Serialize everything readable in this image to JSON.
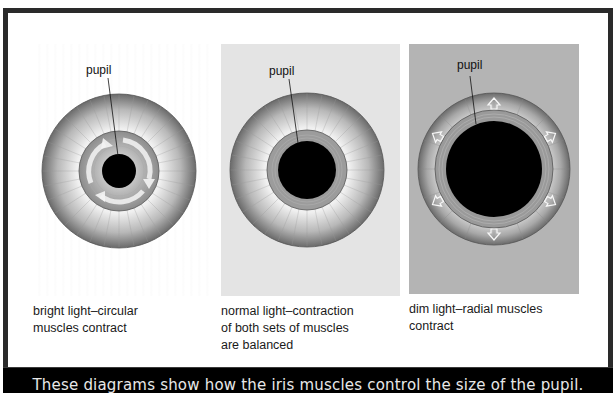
{
  "figure": {
    "caption": "These diagrams show how the iris muscles control the size of the pupil.",
    "colors": {
      "frame": "#2a2a2a",
      "caption_bar": "#000000",
      "caption_text": "#e8e8e8",
      "panel_1_bg": "#ffffff",
      "panel_2_bg": "#e4e4e4",
      "panel_3_bg": "#b4b4b4",
      "pupil": "#000000",
      "iris_outer": "#777777",
      "iris_inner": "#f2f2f2",
      "sphincter_ring": "#9a9a9a"
    },
    "panels": [
      {
        "id": "bright",
        "pupil_label": "pupil",
        "caption": "bright light–circular\nmuscles contract",
        "condition": "bright light",
        "muscles": "circular muscles contract",
        "pupil_size": "small",
        "arrows": "circular (clockwise)"
      },
      {
        "id": "normal",
        "pupil_label": "pupil",
        "caption": "normal light–contraction\nof both sets of muscles\nare balanced",
        "condition": "normal light",
        "muscles": "contraction of both sets of muscles are balanced",
        "pupil_size": "medium",
        "arrows": "none"
      },
      {
        "id": "dim",
        "pupil_label": "pupil",
        "caption": "dim light–radial muscles\ncontract",
        "condition": "dim light",
        "muscles": "radial muscles contract",
        "pupil_size": "large",
        "arrows": "radial outward (6)"
      }
    ]
  }
}
